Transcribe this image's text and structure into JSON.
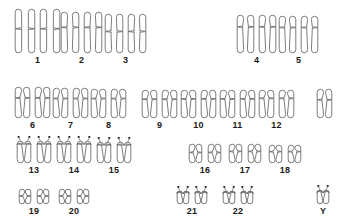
{
  "figure": {
    "kind": "karyotype-diagram",
    "background_color": "#ffffff",
    "outline_color": "#6e6e6e",
    "label_color": "#1a1a1a"
  },
  "chart_data": {
    "type": "diagram",
    "title": "",
    "xlabel": "",
    "ylabel": "",
    "categories": [
      "1",
      "2",
      "3",
      "4",
      "5",
      "6",
      "7",
      "8",
      "9",
      "10",
      "11",
      "12",
      "13",
      "14",
      "15",
      "16",
      "17",
      "18",
      "19",
      "20",
      "21",
      "22",
      "X",
      "Y"
    ],
    "values": [
      2,
      2,
      2,
      2,
      2,
      2,
      2,
      2,
      2,
      2,
      2,
      2,
      2,
      2,
      2,
      2,
      2,
      2,
      2,
      2,
      2,
      2,
      1,
      1
    ],
    "legend": []
  },
  "rows": [
    {
      "name": "row-a",
      "top": 8,
      "groups": [
        {
          "label": "1",
          "left": 14,
          "count": 2,
          "shape": "metacentric",
          "width": 22,
          "height": 46,
          "gap": 3,
          "arm_upper": 0.45
        },
        {
          "label": "2",
          "left": 60,
          "count": 2,
          "shape": "submetacentric",
          "width": 20,
          "height": 43,
          "gap": 3,
          "arm_upper": 0.38
        },
        {
          "label": "3",
          "left": 104,
          "count": 2,
          "shape": "metacentric",
          "width": 20,
          "height": 41,
          "gap": 3,
          "arm_upper": 0.45
        },
        {
          "label": "4",
          "left": 236,
          "count": 2,
          "shape": "submetacentric",
          "width": 19,
          "height": 40,
          "gap": 3,
          "arm_upper": 0.32
        },
        {
          "label": "5",
          "left": 278,
          "count": 2,
          "shape": "submetacentric",
          "width": 19,
          "height": 39,
          "gap": 3,
          "arm_upper": 0.32
        }
      ],
      "label_top": 54
    },
    {
      "name": "row-b",
      "top": 86,
      "groups": [
        {
          "label": "6",
          "left": 14,
          "count": 2,
          "shape": "submetacentric",
          "width": 17,
          "height": 33,
          "gap": 3,
          "arm_upper": 0.36
        },
        {
          "label": "7",
          "left": 52,
          "count": 2,
          "shape": "submetacentric",
          "width": 17,
          "height": 32,
          "gap": 3,
          "arm_upper": 0.36
        },
        {
          "label": "8",
          "left": 90,
          "count": 2,
          "shape": "submetacentric",
          "width": 17,
          "height": 31,
          "gap": 3,
          "arm_upper": 0.34
        },
        {
          "label": "9",
          "left": 141,
          "count": 2,
          "shape": "submetacentric",
          "width": 17,
          "height": 30,
          "gap": 3,
          "arm_upper": 0.34
        },
        {
          "label": "10",
          "left": 180,
          "count": 2,
          "shape": "submetacentric",
          "width": 17,
          "height": 30,
          "gap": 3,
          "arm_upper": 0.33
        },
        {
          "label": "11",
          "left": 219,
          "count": 2,
          "shape": "submetacentric",
          "width": 17,
          "height": 30,
          "gap": 3,
          "arm_upper": 0.33
        },
        {
          "label": "12",
          "left": 258,
          "count": 2,
          "shape": "submetacentric",
          "width": 17,
          "height": 30,
          "gap": 3,
          "arm_upper": 0.31
        },
        {
          "label": "",
          "left": 316,
          "count": 1,
          "shape": "submetacentric",
          "width": 17,
          "height": 31,
          "gap": 3,
          "arm_upper": 0.38
        }
      ],
      "label_top": 119
    },
    {
      "name": "row-c",
      "top": 140,
      "groups": [
        {
          "label": "13",
          "left": 16,
          "count": 2,
          "shape": "acrocentric",
          "width": 16,
          "height": 24,
          "gap": 4,
          "arm_upper": 0.16
        },
        {
          "label": "14",
          "left": 56,
          "count": 2,
          "shape": "acrocentric",
          "width": 16,
          "height": 24,
          "gap": 4,
          "arm_upper": 0.16
        },
        {
          "label": "15",
          "left": 96,
          "count": 2,
          "shape": "acrocentric",
          "width": 16,
          "height": 23,
          "gap": 4,
          "arm_upper": 0.16
        },
        {
          "label": "16",
          "left": 188,
          "count": 2,
          "shape": "metacentric",
          "width": 15,
          "height": 21,
          "gap": 4,
          "arm_upper": 0.45
        },
        {
          "label": "17",
          "left": 228,
          "count": 2,
          "shape": "submetacentric",
          "width": 15,
          "height": 21,
          "gap": 4,
          "arm_upper": 0.4
        },
        {
          "label": "18",
          "left": 268,
          "count": 2,
          "shape": "submetacentric",
          "width": 15,
          "height": 20,
          "gap": 4,
          "arm_upper": 0.38
        }
      ],
      "label_top": 164
    },
    {
      "name": "row-d",
      "top": 188,
      "groups": [
        {
          "label": "19",
          "left": 18,
          "count": 2,
          "shape": "metacentric",
          "width": 14,
          "height": 17,
          "gap": 4,
          "arm_upper": 0.47
        },
        {
          "label": "20",
          "left": 58,
          "count": 2,
          "shape": "metacentric",
          "width": 14,
          "height": 17,
          "gap": 4,
          "arm_upper": 0.47
        },
        {
          "label": "21",
          "left": 176,
          "count": 2,
          "shape": "acrocentric",
          "width": 14,
          "height": 15,
          "gap": 4,
          "arm_upper": 0.14
        },
        {
          "label": "22",
          "left": 222,
          "count": 2,
          "shape": "acrocentric",
          "width": 14,
          "height": 15,
          "gap": 4,
          "arm_upper": 0.14
        },
        {
          "label": "Y",
          "left": 316,
          "count": 1,
          "shape": "acrocentric",
          "width": 14,
          "height": 16,
          "gap": 4,
          "arm_upper": 0.14
        }
      ],
      "label_top": 205
    }
  ]
}
